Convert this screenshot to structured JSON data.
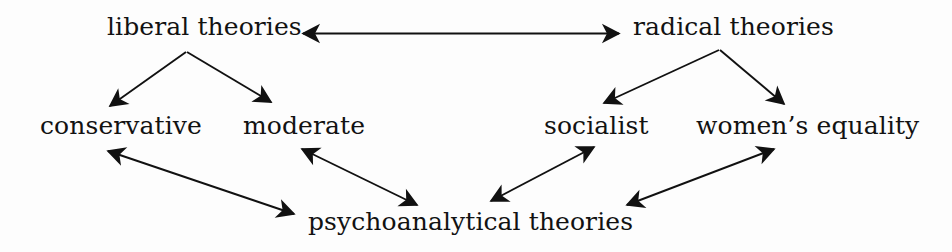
{
  "diagram": {
    "background_color": "#fdfdfd",
    "line_color": "#111111",
    "text_color": "#121212",
    "nodes": [
      {
        "id": "liberal",
        "label": "liberal theories",
        "row": "top",
        "x": 200,
        "y": 33
      },
      {
        "id": "radical",
        "label": "radical theories",
        "row": "top",
        "x": 736,
        "y": 33
      },
      {
        "id": "conserv",
        "label": "conservative",
        "row": "middle",
        "x": 117,
        "y": 131
      },
      {
        "id": "moderate",
        "label": "moderate",
        "row": "middle",
        "x": 302,
        "y": 131
      },
      {
        "id": "socialist",
        "label": "socialist",
        "row": "middle",
        "x": 595,
        "y": 131
      },
      {
        "id": "women",
        "label": "women’s equality",
        "row": "middle",
        "x": 801,
        "y": 131
      },
      {
        "id": "psycho",
        "label": "psychoanalytical theories",
        "row": "bottom",
        "x": 462,
        "y": 227
      }
    ],
    "edges": [
      {
        "from": "liberal",
        "to": "radical",
        "arrowheads": "both",
        "style": "straight-horizontal"
      },
      {
        "from": "liberal",
        "to": "conserv",
        "arrowheads": "end",
        "style": "diagonal-down-left"
      },
      {
        "from": "liberal",
        "to": "moderate",
        "arrowheads": "end",
        "style": "diagonal-down-right"
      },
      {
        "from": "radical",
        "to": "socialist",
        "arrowheads": "end",
        "style": "diagonal-down-left"
      },
      {
        "from": "radical",
        "to": "women",
        "arrowheads": "end",
        "style": "diagonal-down-right"
      },
      {
        "from": "conserv",
        "to": "psycho",
        "arrowheads": "both",
        "style": "diagonal"
      },
      {
        "from": "moderate",
        "to": "psycho",
        "arrowheads": "both",
        "style": "diagonal"
      },
      {
        "from": "socialist",
        "to": "psycho",
        "arrowheads": "both",
        "style": "diagonal"
      },
      {
        "from": "women",
        "to": "psycho",
        "arrowheads": "both",
        "style": "diagonal"
      }
    ]
  }
}
